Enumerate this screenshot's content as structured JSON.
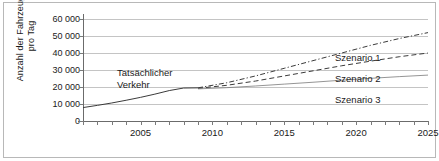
{
  "chart_data": {
    "type": "line",
    "title": "",
    "xlabel": "",
    "ylabel": "Anzahl der Fahrzeuge\npro Tag",
    "xlim": [
      2001,
      2025
    ],
    "ylim": [
      0,
      60000
    ],
    "grid": true,
    "legend_position": "inline-right",
    "y_ticks": [
      0,
      10000,
      20000,
      30000,
      40000,
      50000,
      60000
    ],
    "y_tick_labels": [
      "0",
      "10 000",
      "20 000",
      "30 000",
      "40 000",
      "50 000",
      "60 000"
    ],
    "x_ticks": [
      2001,
      2002,
      2003,
      2004,
      2005,
      2006,
      2007,
      2008,
      2009,
      2010,
      2011,
      2012,
      2013,
      2014,
      2015,
      2016,
      2017,
      2018,
      2019,
      2020,
      2021,
      2022,
      2023,
      2024,
      2025
    ],
    "x_tick_labels_shown": [
      "2005",
      "2010",
      "2015",
      "2020",
      "2025"
    ],
    "annotations": [
      {
        "text": "Tatsächlicher\nVerkehr",
        "x": 2004.2,
        "y": 24000
      }
    ],
    "series": [
      {
        "name": "Tatsächlicher Verkehr",
        "style": "solid",
        "color": "#3b3b3b",
        "x": [
          2001,
          2002,
          2003,
          2004,
          2005,
          2006,
          2007,
          2008,
          2009
        ],
        "values": [
          7900,
          9200,
          10600,
          12200,
          13900,
          15800,
          17900,
          19400,
          19500
        ]
      },
      {
        "name": "Szenario 1",
        "label": "Szenario 1",
        "style": "dash-dot",
        "color": "#3b3b3b",
        "x": [
          2009,
          2011,
          2013,
          2015,
          2017,
          2019,
          2021,
          2023,
          2025
        ],
        "values": [
          19500,
          22500,
          26500,
          31000,
          35500,
          40000,
          44500,
          48500,
          52000
        ]
      },
      {
        "name": "Szenario 2",
        "label": "Szenario 2",
        "style": "dashed",
        "color": "#3b3b3b",
        "x": [
          2009,
          2011,
          2013,
          2015,
          2017,
          2019,
          2021,
          2023,
          2025
        ],
        "values": [
          19200,
          21000,
          23500,
          26500,
          29500,
          32500,
          35200,
          37800,
          40000
        ]
      },
      {
        "name": "Szenario 3",
        "label": "Szenario 3",
        "style": "solid-thin",
        "color": "#7a7a7a",
        "x": [
          2009,
          2011,
          2013,
          2015,
          2017,
          2019,
          2021,
          2023,
          2025
        ],
        "values": [
          18900,
          19600,
          20600,
          21700,
          22800,
          24000,
          25100,
          26100,
          27000
        ]
      }
    ]
  }
}
